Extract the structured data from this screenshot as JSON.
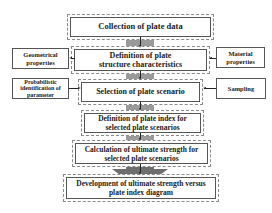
{
  "diagram": {
    "type": "flowchart",
    "main_steps": [
      {
        "id": "collection",
        "label": "Collection of plate data"
      },
      {
        "id": "definition",
        "label": "Definition of plate structure characteristics"
      },
      {
        "id": "selection",
        "label": "Selection of plate scenario"
      },
      {
        "id": "plate_index",
        "label": "Definition of plate index for selected plate scenarios"
      },
      {
        "id": "calculation",
        "label": "Calculation of ultimate strength for selected plate scenarios"
      },
      {
        "id": "development",
        "label": "Development of ultimate strength versus plate index diagram"
      }
    ],
    "side_inputs": {
      "geometrical": "Geometrical properties",
      "material": "Material properties",
      "probabilistic": "Probabilistic identification of parameter",
      "sampling": "Sampling"
    },
    "edges": [
      {
        "from": "collection",
        "to": "definition"
      },
      {
        "from": "definition",
        "to": "selection"
      },
      {
        "from": "selection",
        "to": "plate_index"
      },
      {
        "from": "plate_index",
        "to": "calculation"
      },
      {
        "from": "calculation",
        "to": "development"
      },
      {
        "from": "definition",
        "to": "geometrical"
      },
      {
        "from": "material",
        "to": "definition"
      },
      {
        "from": "probabilistic",
        "to": "selection"
      },
      {
        "from": "sampling",
        "to": "selection"
      }
    ],
    "colors": {
      "connector": "#9a9a9a",
      "connector_dark": "#7a7a7a",
      "border": "#555555",
      "dashed_border": "#8a8a8a",
      "text": "#222222"
    }
  }
}
